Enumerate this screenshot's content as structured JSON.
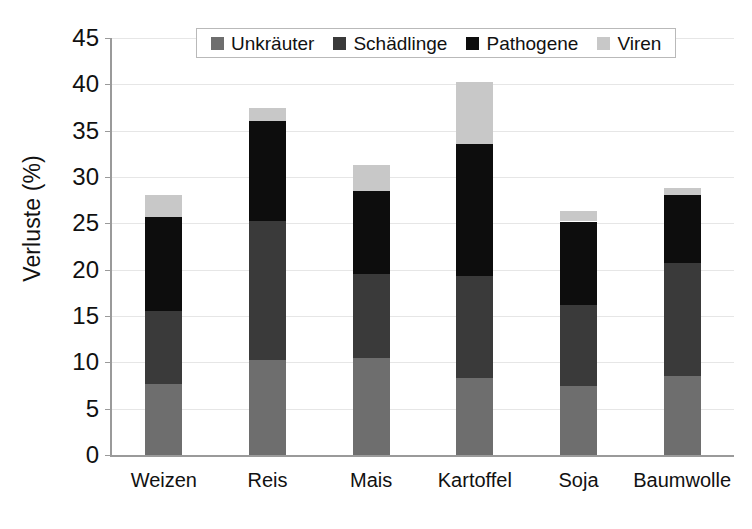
{
  "chart_data": {
    "type": "bar",
    "subtype": "stacked-bar",
    "title": "",
    "xlabel": "",
    "ylabel": "Verluste (%)",
    "ylim": [
      0,
      45
    ],
    "ytick_step": 5,
    "yticks": [
      0,
      5,
      10,
      15,
      20,
      25,
      30,
      35,
      40,
      45
    ],
    "ytick_labels": [
      "0",
      "5",
      "10",
      "15",
      "20",
      "25",
      "30",
      "35",
      "40",
      "45"
    ],
    "grid": true,
    "grid_axis": "y",
    "legend_position": "top-center-inside",
    "categories": [
      "Weizen",
      "Reis",
      "Mais",
      "Kartoffel",
      "Soja",
      "Baumwolle"
    ],
    "series": [
      {
        "name": "Unkräuter",
        "color": "#6e6e6e",
        "values": [
          7.7,
          10.2,
          10.5,
          8.3,
          7.5,
          8.5
        ]
      },
      {
        "name": "Schädlinge",
        "color": "#3a3a3a",
        "values": [
          7.8,
          15.1,
          9.0,
          11.0,
          8.7,
          12.2
        ]
      },
      {
        "name": "Pathogene",
        "color": "#0d0d0d",
        "values": [
          10.2,
          10.7,
          9.0,
          14.3,
          9.0,
          7.4
        ]
      },
      {
        "name": "Viren",
        "color": "#c8c8c8",
        "values": [
          2.4,
          1.5,
          2.8,
          6.6,
          1.1,
          0.7
        ]
      }
    ],
    "totals": [
      28.1,
      37.5,
      31.3,
      40.2,
      26.3,
      28.8
    ]
  },
  "legend": {
    "items": [
      {
        "label": "Unkräuter",
        "color": "#6e6e6e"
      },
      {
        "label": "Schädlinge",
        "color": "#3a3a3a"
      },
      {
        "label": "Pathogene",
        "color": "#0d0d0d"
      },
      {
        "label": "Viren",
        "color": "#c8c8c8"
      }
    ]
  },
  "axes": {
    "y_title": "Verluste (%)",
    "axis_color": "#9a9a9a",
    "grid_color": "#e6e6e6"
  }
}
